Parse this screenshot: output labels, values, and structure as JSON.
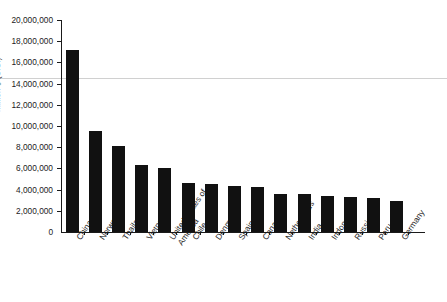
{
  "chart_data": {
    "type": "bar",
    "title": "",
    "xlabel": "",
    "ylabel": "Million $ (U.S.)",
    "ylim": [
      0,
      20000000
    ],
    "ytick_interval": 2000000,
    "grid": false,
    "legend": null,
    "orientation": "vertical",
    "bar_color": "#111111",
    "categories": [
      "China",
      "Norway",
      "Thailand",
      "Vietnam",
      "United States of America",
      "Chile",
      "Denmark",
      "Spain",
      "Canada",
      "Netherlands",
      "India",
      "Indonesia",
      "Russia",
      "Peru",
      "Germany"
    ],
    "values": [
      17200000,
      9500000,
      8100000,
      6300000,
      6000000,
      4600000,
      4550000,
      4300000,
      4250000,
      3600000,
      3550000,
      3400000,
      3300000,
      3200000,
      2950000
    ],
    "ytick_labels": [
      "20,000,000",
      "18,000,000",
      "16,000,000",
      "14,000,000",
      "12,000,000",
      "10,000,000",
      "8,000,000",
      "6,000,000",
      "4,000,000",
      "2,000,000",
      "0"
    ],
    "ytick_values": [
      20000000,
      18000000,
      16000000,
      14000000,
      12000000,
      10000000,
      8000000,
      6000000,
      4000000,
      2000000,
      0
    ],
    "annotations": [
      {
        "name": "scan-artifact-line",
        "value": 14000000,
        "color": "#c8c8c8",
        "spans_full_image": true
      }
    ]
  }
}
